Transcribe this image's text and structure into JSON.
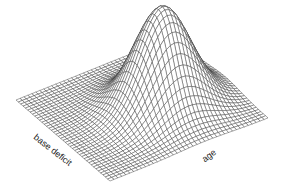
{
  "chart_data": {
    "type": "surface",
    "title": "",
    "xlabel": "base deficit",
    "ylabel": "age",
    "zlabel": "",
    "grid_size": 40,
    "surface": {
      "shape": "gaussian-bump",
      "peak_height": 1.0,
      "center_x": 0.55,
      "center_y": 0.6,
      "spread": 0.16,
      "baseline": 0.0
    },
    "view": {
      "left_corner": [
        16,
        100
      ],
      "front_corner": [
        110,
        181
      ],
      "right_corner": [
        268,
        118
      ],
      "peak_pixel_height": 100
    },
    "colors": {
      "mesh": "#3a3a3a",
      "fill": "#ffffff"
    },
    "axes": {
      "ticks": false,
      "grid": "wireframe"
    }
  }
}
